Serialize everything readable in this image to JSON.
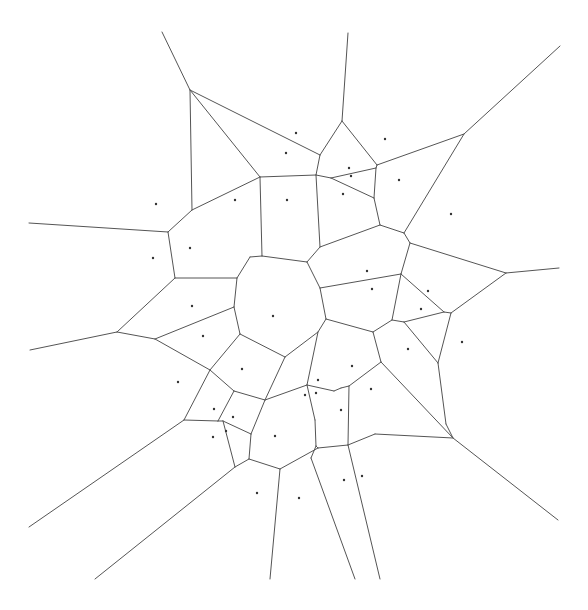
{
  "diagram": {
    "type": "voronoi",
    "title": "",
    "colors": {
      "background": "#ffffff",
      "edge": "#555555",
      "site": "#333333"
    },
    "sites": [
      [
        296,
        133
      ],
      [
        286,
        153
      ],
      [
        385,
        139
      ],
      [
        349,
        168
      ],
      [
        351,
        176
      ],
      [
        399,
        180
      ],
      [
        156,
        204
      ],
      [
        235,
        200
      ],
      [
        287,
        200
      ],
      [
        343,
        194
      ],
      [
        451,
        214
      ],
      [
        190,
        248
      ],
      [
        153,
        258
      ],
      [
        367,
        271
      ],
      [
        372,
        289
      ],
      [
        192,
        306
      ],
      [
        428,
        291
      ],
      [
        421,
        309
      ],
      [
        273,
        316
      ],
      [
        203,
        336
      ],
      [
        462,
        342
      ],
      [
        408,
        349
      ],
      [
        178,
        382
      ],
      [
        242,
        369
      ],
      [
        352,
        366
      ],
      [
        371,
        389
      ],
      [
        318,
        380
      ],
      [
        305,
        395
      ],
      [
        316,
        393
      ],
      [
        341,
        410
      ],
      [
        214,
        409
      ],
      [
        233,
        417
      ],
      [
        226,
        431
      ],
      [
        213,
        437
      ],
      [
        275,
        436
      ],
      [
        257,
        493
      ],
      [
        299,
        498
      ],
      [
        344,
        480
      ],
      [
        362,
        476
      ]
    ],
    "vertices": [
      [
        162,
        32
      ],
      [
        190,
        90
      ],
      [
        348,
        33
      ],
      [
        342,
        121
      ],
      [
        320,
        155
      ],
      [
        377,
        165
      ],
      [
        464,
        134
      ],
      [
        560,
        46
      ],
      [
        260,
        177
      ],
      [
        316,
        175
      ],
      [
        331,
        178
      ],
      [
        376,
        168
      ],
      [
        374,
        198
      ],
      [
        380,
        225
      ],
      [
        320,
        247
      ],
      [
        192,
        210
      ],
      [
        168,
        232
      ],
      [
        29,
        223
      ],
      [
        250,
        257
      ],
      [
        262,
        256
      ],
      [
        307,
        262
      ],
      [
        320,
        288
      ],
      [
        326,
        319
      ],
      [
        318,
        332
      ],
      [
        285,
        357
      ],
      [
        240,
        334
      ],
      [
        234,
        307
      ],
      [
        237,
        278
      ],
      [
        175,
        278
      ],
      [
        117,
        332
      ],
      [
        30,
        350
      ],
      [
        155,
        339
      ],
      [
        404,
        233
      ],
      [
        410,
        243
      ],
      [
        506,
        273
      ],
      [
        559,
        268
      ],
      [
        401,
        274
      ],
      [
        444,
        312
      ],
      [
        451,
        313
      ],
      [
        392,
        320
      ],
      [
        404,
        322
      ],
      [
        373,
        332
      ],
      [
        381,
        362
      ],
      [
        438,
        363
      ],
      [
        446,
        424
      ],
      [
        453,
        438
      ],
      [
        558,
        520
      ],
      [
        210,
        370
      ],
      [
        234,
        391
      ],
      [
        265,
        400
      ],
      [
        184,
        420
      ],
      [
        218,
        421
      ],
      [
        223,
        421
      ],
      [
        251,
        434
      ],
      [
        235,
        467
      ],
      [
        249,
        459
      ],
      [
        280,
        469
      ],
      [
        307,
        385
      ],
      [
        334,
        391
      ],
      [
        341,
        388
      ],
      [
        349,
        386
      ],
      [
        316,
        446
      ],
      [
        318,
        448
      ],
      [
        348,
        445
      ],
      [
        375,
        434
      ],
      [
        29,
        527
      ],
      [
        95,
        579
      ],
      [
        270,
        579
      ],
      [
        355,
        579
      ],
      [
        380,
        579
      ],
      [
        311,
        458
      ],
      [
        315,
        420
      ]
    ],
    "edges": [
      [
        0,
        1
      ],
      [
        1,
        4
      ],
      [
        1,
        15
      ],
      [
        1,
        8
      ],
      [
        2,
        3
      ],
      [
        3,
        4
      ],
      [
        3,
        5
      ],
      [
        5,
        6
      ],
      [
        6,
        7
      ],
      [
        4,
        9
      ],
      [
        8,
        9
      ],
      [
        9,
        10
      ],
      [
        10,
        11
      ],
      [
        5,
        11
      ],
      [
        11,
        12
      ],
      [
        10,
        12
      ],
      [
        12,
        13
      ],
      [
        13,
        14
      ],
      [
        9,
        14
      ],
      [
        8,
        19
      ],
      [
        15,
        16
      ],
      [
        16,
        17
      ],
      [
        15,
        8
      ],
      [
        16,
        28
      ],
      [
        18,
        19
      ],
      [
        19,
        20
      ],
      [
        20,
        14
      ],
      [
        20,
        21
      ],
      [
        21,
        22
      ],
      [
        22,
        23
      ],
      [
        23,
        24
      ],
      [
        24,
        25
      ],
      [
        25,
        26
      ],
      [
        26,
        27
      ],
      [
        27,
        18
      ],
      [
        27,
        28
      ],
      [
        28,
        29
      ],
      [
        29,
        30
      ],
      [
        29,
        31
      ],
      [
        31,
        26
      ],
      [
        31,
        47
      ],
      [
        25,
        47
      ],
      [
        13,
        32
      ],
      [
        32,
        33
      ],
      [
        6,
        32
      ],
      [
        33,
        34
      ],
      [
        34,
        35
      ],
      [
        33,
        36
      ],
      [
        21,
        36
      ],
      [
        36,
        39
      ],
      [
        36,
        37
      ],
      [
        37,
        38
      ],
      [
        38,
        34
      ],
      [
        37,
        40
      ],
      [
        39,
        40
      ],
      [
        39,
        41
      ],
      [
        22,
        41
      ],
      [
        41,
        42
      ],
      [
        40,
        43
      ],
      [
        38,
        43
      ],
      [
        43,
        44
      ],
      [
        44,
        45
      ],
      [
        45,
        46
      ],
      [
        42,
        45
      ],
      [
        42,
        60
      ],
      [
        47,
        48
      ],
      [
        48,
        49
      ],
      [
        24,
        49
      ],
      [
        47,
        50
      ],
      [
        50,
        65
      ],
      [
        50,
        51
      ],
      [
        51,
        52
      ],
      [
        48,
        51
      ],
      [
        52,
        53
      ],
      [
        49,
        53
      ],
      [
        53,
        55
      ],
      [
        52,
        54
      ],
      [
        54,
        66
      ],
      [
        54,
        55
      ],
      [
        55,
        56
      ],
      [
        56,
        67
      ],
      [
        49,
        57
      ],
      [
        57,
        58
      ],
      [
        58,
        59
      ],
      [
        59,
        60
      ],
      [
        57,
        71
      ],
      [
        58,
        72
      ],
      [
        59,
        72
      ],
      [
        60,
        63
      ],
      [
        63,
        64
      ],
      [
        64,
        45
      ],
      [
        63,
        69
      ],
      [
        56,
        62
      ],
      [
        62,
        61
      ],
      [
        61,
        70
      ],
      [
        62,
        63
      ],
      [
        70,
        68
      ],
      [
        23,
        57
      ],
      [
        72,
        61
      ],
      [
        71,
        61
      ]
    ]
  }
}
